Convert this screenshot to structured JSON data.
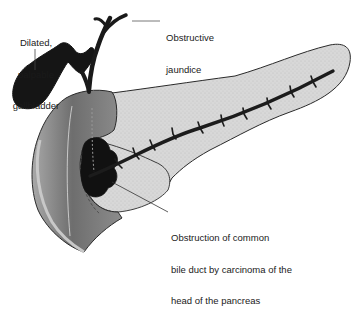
{
  "diagram": {
    "type": "anatomical-illustration",
    "colors": {
      "background": "#ffffff",
      "outline": "#222222",
      "pancreas_fill": "#d6d6d6",
      "duodenum_fill": "#8a8a8a",
      "duodenum_inner": "#bdbdbd",
      "tumor": "#111111",
      "gallbladder": "#151515",
      "duct": "#1e1e1e"
    },
    "labels": {
      "gallbladder": {
        "lines": [
          "Dilated,",
          "palpable",
          "gallbladder"
        ]
      },
      "jaundice": {
        "lines": [
          "Obstructive",
          "jaundice"
        ]
      },
      "obstruction": {
        "lines": [
          "Obstruction of common",
          "bile duct by carcinoma of the",
          "head of the pancreas"
        ]
      }
    },
    "structures": [
      {
        "name": "gallbladder",
        "label": "Dilated, palpable gallbladder"
      },
      {
        "name": "bile-ducts",
        "label": "Obstructive jaundice"
      },
      {
        "name": "duodenum"
      },
      {
        "name": "pancreas"
      },
      {
        "name": "pancreatic-duct"
      },
      {
        "name": "tumor",
        "label": "Obstruction of common bile duct by carcinoma of the head of the pancreas"
      }
    ]
  }
}
